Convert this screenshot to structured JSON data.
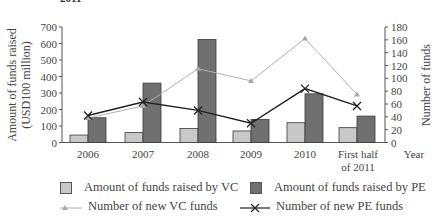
{
  "title_fragment": "2011",
  "chart_data": {
    "type": "bar",
    "title": "",
    "xlabel": "Year",
    "ylabel": "Amount of funds raised (USD100 million)",
    "y2label": "Number of funds",
    "categories": [
      "2006",
      "2007",
      "2008",
      "2009",
      "2010",
      "First half of 2011"
    ],
    "ylim": [
      0,
      700
    ],
    "y_ticks": [
      0,
      100,
      200,
      300,
      400,
      500,
      600,
      700
    ],
    "y2lim": [
      0,
      180
    ],
    "y2_ticks": [
      0,
      20,
      40,
      60,
      80,
      100,
      120,
      140,
      160,
      180
    ],
    "grid": false,
    "legend_position": "bottom",
    "series": [
      {
        "name": "Amount of funds raised by VC",
        "type": "bar",
        "axis": "left",
        "color": "#c8c8c8",
        "values": [
          45,
          60,
          85,
          70,
          120,
          90
        ]
      },
      {
        "name": "Amount of funds raised by PE",
        "type": "bar",
        "axis": "left",
        "color": "#707070",
        "values": [
          150,
          360,
          625,
          140,
          295,
          160
        ]
      },
      {
        "name": "Number of new VC funds",
        "type": "line",
        "marker": "triangle",
        "axis": "right",
        "color": "#b0b0b0",
        "values": [
          38,
          57,
          115,
          96,
          162,
          75
        ]
      },
      {
        "name": "Number of new PE funds",
        "type": "line",
        "marker": "x",
        "axis": "right",
        "color": "#222222",
        "values": [
          42,
          63,
          50,
          30,
          84,
          57
        ]
      }
    ]
  },
  "axis": {
    "left_title_line1": "Amount of funds raised",
    "left_title_line2": "(USD100 million)",
    "right_title": "Number of funds",
    "x_title": "Year",
    "x_labels": [
      "2006",
      "2007",
      "2008",
      "2009",
      "2010",
      "First half",
      "of 2011"
    ]
  },
  "legend": {
    "vc_amount": "Amount of funds raised by VC",
    "pe_amount": "Amount of funds raised by PE",
    "vc_count": "Number of new VC funds",
    "pe_count": "Number of new PE funds"
  }
}
